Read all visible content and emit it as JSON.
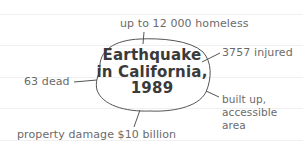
{
  "diagram": {
    "type": "spider-diagram",
    "center": {
      "lines": [
        "Earthquake",
        "in California,",
        "1989"
      ]
    },
    "branches": [
      {
        "id": "homeless",
        "text": "up to 12 000 homeless"
      },
      {
        "id": "injured",
        "text": "3757 injured"
      },
      {
        "id": "dead",
        "text": "63 dead"
      },
      {
        "id": "area",
        "lines": [
          "built up,",
          "accessible",
          "area"
        ]
      },
      {
        "id": "damage",
        "text": "property damage $10 billion"
      }
    ],
    "colors": {
      "text": "#6a6a6a",
      "center_text": "#3a3a3a",
      "lines": "#555555",
      "ruled_lines": "#f0f0f0"
    }
  }
}
